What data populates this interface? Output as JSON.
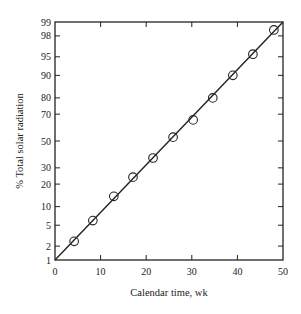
{
  "chart_data": {
    "type": "scatter",
    "title": "",
    "xlabel": "Calendar time, wk",
    "ylabel": "% Total solar radiation",
    "x_scale": "linear",
    "y_scale": "probability",
    "xlim": [
      0,
      50
    ],
    "ylim": [
      1,
      99
    ],
    "x_ticks": [
      0,
      10,
      20,
      30,
      40,
      50
    ],
    "x_tick_labels": [
      "0",
      "10",
      "20",
      "30",
      "40",
      "50"
    ],
    "y_ticks": [
      1,
      2,
      5,
      10,
      20,
      30,
      50,
      70,
      80,
      90,
      95,
      98,
      99
    ],
    "y_tick_labels": [
      "1",
      "2",
      "5",
      "10",
      "20",
      "30",
      "50",
      "70",
      "80",
      "90",
      "95",
      "98",
      "99"
    ],
    "grid": false,
    "legend": null,
    "series": [
      {
        "name": "observed",
        "marker": "open-circle",
        "x": [
          4.2,
          8.3,
          12.9,
          17.1,
          21.5,
          25.9,
          30.3,
          34.6,
          39.0,
          43.4,
          48.0
        ],
        "y": [
          2.5,
          6,
          14,
          24,
          37,
          53,
          66,
          80,
          90,
          95.5,
          98.5
        ]
      },
      {
        "name": "fit line",
        "style": "solid-line",
        "x": [
          0,
          50
        ],
        "y": [
          1,
          99
        ]
      }
    ]
  }
}
